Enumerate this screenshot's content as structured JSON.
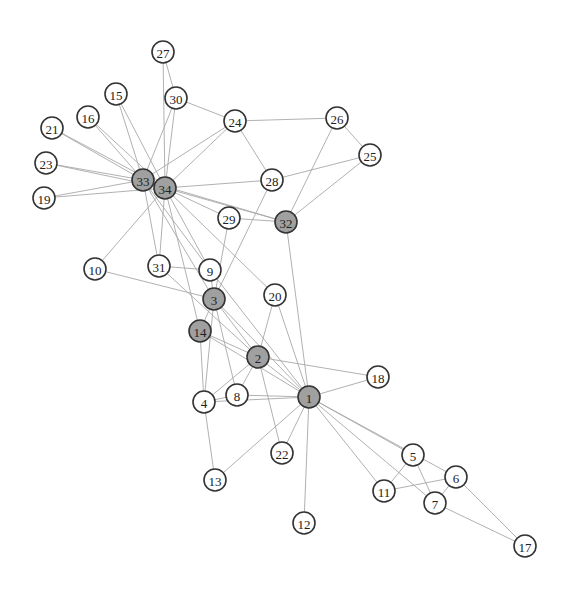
{
  "graph": {
    "title": "",
    "colors": {
      "background": "#ffffff",
      "edge": "#a8a8a8",
      "node_stroke": "#333333",
      "node_fill_default": "#ffffff",
      "node_fill_highlighted": "#a0a0a0",
      "label": "#222222"
    },
    "node_radius": 11,
    "nodes": [
      {
        "id": "1",
        "x": 309,
        "y": 397,
        "highlighted": true
      },
      {
        "id": "2",
        "x": 258,
        "y": 357,
        "highlighted": true
      },
      {
        "id": "3",
        "x": 214,
        "y": 299,
        "highlighted": true
      },
      {
        "id": "4",
        "x": 204,
        "y": 402,
        "highlighted": false
      },
      {
        "id": "5",
        "x": 413,
        "y": 455,
        "highlighted": false
      },
      {
        "id": "6",
        "x": 456,
        "y": 477,
        "highlighted": false
      },
      {
        "id": "7",
        "x": 435,
        "y": 503,
        "highlighted": false
      },
      {
        "id": "8",
        "x": 237,
        "y": 395,
        "highlighted": false
      },
      {
        "id": "9",
        "x": 210,
        "y": 270,
        "highlighted": false
      },
      {
        "id": "10",
        "x": 95,
        "y": 269,
        "highlighted": false
      },
      {
        "id": "11",
        "x": 384,
        "y": 491,
        "highlighted": false
      },
      {
        "id": "12",
        "x": 304,
        "y": 523,
        "highlighted": false
      },
      {
        "id": "13",
        "x": 215,
        "y": 480,
        "highlighted": false
      },
      {
        "id": "14",
        "x": 200,
        "y": 331,
        "highlighted": true
      },
      {
        "id": "15",
        "x": 116,
        "y": 94,
        "highlighted": false
      },
      {
        "id": "16",
        "x": 88,
        "y": 117,
        "highlighted": false
      },
      {
        "id": "17",
        "x": 525,
        "y": 546,
        "highlighted": false
      },
      {
        "id": "18",
        "x": 378,
        "y": 377,
        "highlighted": false
      },
      {
        "id": "19",
        "x": 44,
        "y": 198,
        "highlighted": false
      },
      {
        "id": "20",
        "x": 275,
        "y": 295,
        "highlighted": false
      },
      {
        "id": "21",
        "x": 52,
        "y": 128,
        "highlighted": false
      },
      {
        "id": "22",
        "x": 282,
        "y": 453,
        "highlighted": false
      },
      {
        "id": "23",
        "x": 46,
        "y": 163,
        "highlighted": false
      },
      {
        "id": "24",
        "x": 235,
        "y": 121,
        "highlighted": false
      },
      {
        "id": "25",
        "x": 370,
        "y": 155,
        "highlighted": false
      },
      {
        "id": "26",
        "x": 337,
        "y": 118,
        "highlighted": false
      },
      {
        "id": "27",
        "x": 163,
        "y": 52,
        "highlighted": false
      },
      {
        "id": "28",
        "x": 272,
        "y": 180,
        "highlighted": false
      },
      {
        "id": "29",
        "x": 229,
        "y": 218,
        "highlighted": false
      },
      {
        "id": "30",
        "x": 176,
        "y": 98,
        "highlighted": false
      },
      {
        "id": "31",
        "x": 159,
        "y": 266,
        "highlighted": false
      },
      {
        "id": "32",
        "x": 286,
        "y": 222,
        "highlighted": true
      },
      {
        "id": "33",
        "x": 143,
        "y": 180,
        "highlighted": true
      },
      {
        "id": "34",
        "x": 165,
        "y": 188,
        "highlighted": true
      }
    ],
    "edges": [
      [
        "1",
        "2"
      ],
      [
        "1",
        "3"
      ],
      [
        "1",
        "4"
      ],
      [
        "1",
        "5"
      ],
      [
        "1",
        "6"
      ],
      [
        "1",
        "7"
      ],
      [
        "1",
        "8"
      ],
      [
        "1",
        "9"
      ],
      [
        "1",
        "11"
      ],
      [
        "1",
        "12"
      ],
      [
        "1",
        "13"
      ],
      [
        "1",
        "14"
      ],
      [
        "1",
        "18"
      ],
      [
        "1",
        "20"
      ],
      [
        "1",
        "22"
      ],
      [
        "1",
        "32"
      ],
      [
        "2",
        "3"
      ],
      [
        "2",
        "4"
      ],
      [
        "2",
        "8"
      ],
      [
        "2",
        "14"
      ],
      [
        "2",
        "18"
      ],
      [
        "2",
        "20"
      ],
      [
        "2",
        "22"
      ],
      [
        "2",
        "31"
      ],
      [
        "3",
        "4"
      ],
      [
        "3",
        "8"
      ],
      [
        "3",
        "9"
      ],
      [
        "3",
        "10"
      ],
      [
        "3",
        "14"
      ],
      [
        "3",
        "28"
      ],
      [
        "3",
        "29"
      ],
      [
        "3",
        "33"
      ],
      [
        "4",
        "8"
      ],
      [
        "4",
        "13"
      ],
      [
        "4",
        "14"
      ],
      [
        "5",
        "7"
      ],
      [
        "5",
        "11"
      ],
      [
        "6",
        "7"
      ],
      [
        "6",
        "11"
      ],
      [
        "6",
        "17"
      ],
      [
        "7",
        "17"
      ],
      [
        "9",
        "31"
      ],
      [
        "9",
        "33"
      ],
      [
        "9",
        "34"
      ],
      [
        "10",
        "34"
      ],
      [
        "14",
        "34"
      ],
      [
        "15",
        "33"
      ],
      [
        "15",
        "34"
      ],
      [
        "16",
        "33"
      ],
      [
        "16",
        "34"
      ],
      [
        "19",
        "33"
      ],
      [
        "19",
        "34"
      ],
      [
        "20",
        "34"
      ],
      [
        "21",
        "33"
      ],
      [
        "21",
        "34"
      ],
      [
        "23",
        "33"
      ],
      [
        "23",
        "34"
      ],
      [
        "24",
        "26"
      ],
      [
        "24",
        "28"
      ],
      [
        "24",
        "30"
      ],
      [
        "24",
        "33"
      ],
      [
        "24",
        "34"
      ],
      [
        "25",
        "26"
      ],
      [
        "25",
        "28"
      ],
      [
        "25",
        "32"
      ],
      [
        "26",
        "32"
      ],
      [
        "27",
        "30"
      ],
      [
        "27",
        "34"
      ],
      [
        "28",
        "34"
      ],
      [
        "29",
        "32"
      ],
      [
        "29",
        "34"
      ],
      [
        "30",
        "33"
      ],
      [
        "30",
        "34"
      ],
      [
        "31",
        "33"
      ],
      [
        "31",
        "34"
      ],
      [
        "32",
        "33"
      ],
      [
        "32",
        "34"
      ],
      [
        "33",
        "34"
      ]
    ]
  }
}
